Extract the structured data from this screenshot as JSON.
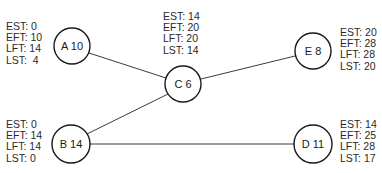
{
  "diagram": {
    "type": "network-diagram",
    "nodes": [
      {
        "id": "A",
        "label": "A 10",
        "duration": 10,
        "cx": 72,
        "cy": 46,
        "r": 18,
        "times": {
          "est": "EST: 0",
          "eft": "EFT: 10",
          "lft": "LFT: 14",
          "lst": "LST:  4"
        }
      },
      {
        "id": "B",
        "label": "B 14",
        "duration": 14,
        "cx": 71,
        "cy": 144,
        "r": 19,
        "times": {
          "est": "EST: 0",
          "eft": "EFT: 14",
          "lft": "LFT: 14",
          "lst": "LST: 0"
        }
      },
      {
        "id": "C",
        "label": "C 6",
        "duration": 6,
        "cx": 183,
        "cy": 84,
        "r": 18,
        "times": {
          "est": "EST: 14",
          "eft": "EFT: 20",
          "lft": "LFT: 20",
          "lst": "LST: 14"
        }
      },
      {
        "id": "D",
        "label": "D 11",
        "duration": 11,
        "cx": 313,
        "cy": 144,
        "r": 19,
        "times": {
          "est": "EST: 14",
          "eft": "EFT: 25",
          "lft": "LFT: 28",
          "lst": "LST: 17"
        }
      },
      {
        "id": "E",
        "label": "E 8",
        "duration": 8,
        "cx": 313,
        "cy": 51,
        "r": 18,
        "times": {
          "est": "EST: 20",
          "eft": "EFT: 28",
          "lft": "LFT: 28",
          "lst": "LST: 20"
        }
      }
    ],
    "edges": [
      {
        "from": "A",
        "to": "C"
      },
      {
        "from": "B",
        "to": "C"
      },
      {
        "from": "C",
        "to": "E"
      },
      {
        "from": "B",
        "to": "D"
      }
    ]
  }
}
